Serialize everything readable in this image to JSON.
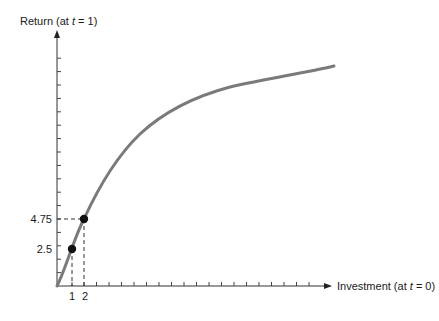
{
  "chart_data": {
    "type": "line",
    "title": "",
    "ylabel": "Return (at t = 1)",
    "xlabel": "Investment (at t = 0)",
    "ylabel_parts": {
      "pre": "Return (at ",
      "var": "t",
      "post": " = 1)"
    },
    "xlabel_parts": {
      "pre": "Investment (at ",
      "var": "t",
      "post": " = 0)"
    },
    "x_tick_labels": [
      "1",
      "2"
    ],
    "y_tick_labels": [
      "2.5",
      "4.75"
    ],
    "grid": false,
    "legend": null,
    "series": [
      {
        "name": "Return curve",
        "color": "#7a7a7a",
        "x": [
          0,
          1,
          2,
          3.4,
          5,
          6.6,
          8.2,
          9.8,
          11.4,
          13,
          14.6,
          16.2,
          17.8,
          19.4,
          21
        ],
        "y": [
          0,
          2.5,
          4.75,
          7.4,
          9.6,
          11.4,
          12.8,
          14.0,
          15.0,
          15.9,
          16.6,
          17.2,
          17.7,
          18.2,
          18.6
        ]
      }
    ],
    "highlighted_points": [
      {
        "x": 1,
        "y": 2.5
      },
      {
        "x": 2,
        "y": 4.75
      }
    ],
    "x_ticks_count": 20,
    "y_ticks_count": 17,
    "xlim": [
      0,
      22
    ],
    "ylim": [
      0,
      21
    ]
  }
}
